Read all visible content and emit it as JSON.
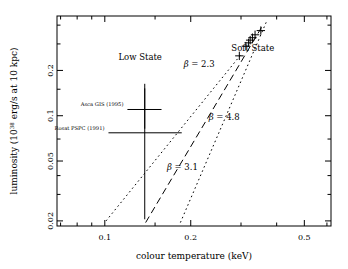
{
  "figure": {
    "kind": "scientific-scatter-plot",
    "background": "#ffffff",
    "ink": "#000000"
  },
  "axes": {
    "x": {
      "label_parts": {
        "text": "colour temperature (keV)"
      },
      "scale": "log",
      "range": [
        0.068,
        0.62
      ],
      "ticks": [
        {
          "value": 0.1,
          "label": "0.1"
        },
        {
          "value": 0.2,
          "label": "0.2"
        },
        {
          "value": 0.5,
          "label": "0.5"
        }
      ],
      "minor_ticks": [
        0.07,
        0.08,
        0.09,
        0.15,
        0.3,
        0.4,
        0.6
      ]
    },
    "y": {
      "label_parts": {
        "prefix": "luminosity (10",
        "exponent": "38",
        "suffix": " erg/s at 10 kpc)"
      },
      "scale": "log",
      "range": [
        0.0185,
        0.46
      ],
      "ticks": [
        {
          "value": 0.02,
          "label": "0.02"
        },
        {
          "value": 0.05,
          "label": "0.05"
        },
        {
          "value": 0.1,
          "label": "0.1"
        },
        {
          "value": 0.2,
          "label": "0.2"
        }
      ],
      "minor_ticks": [
        0.03,
        0.04,
        0.07,
        0.15,
        0.3,
        0.4
      ]
    }
  },
  "annotations": {
    "low_state": "Low State",
    "soft_state": "Soft State",
    "asca": "Asca GIS (1995)",
    "rosat": "Rosat PSPC (1991)"
  },
  "chart_data": {
    "type": "scatter",
    "title": "",
    "xlabel": "colour temperature (keV)",
    "ylabel": "luminosity (10^38 erg/s at 10 kpc)",
    "xscale": "log",
    "yscale": "log",
    "xlim": [
      0.068,
      0.62
    ],
    "ylim": [
      0.0185,
      0.46
    ],
    "grid": false,
    "legend": "none",
    "series": [
      {
        "name": "Soft State",
        "marker": "plus",
        "x": [
          0.296,
          0.312,
          0.319,
          0.323,
          0.329,
          0.336,
          0.352
        ],
        "y": [
          0.25,
          0.29,
          0.305,
          0.318,
          0.33,
          0.345,
          0.368
        ]
      },
      {
        "name": "Low State",
        "marker": "plus-with-errorbars",
        "points": [
          {
            "label": "Asca GIS (1995)",
            "x": 0.138,
            "y": 0.11,
            "xerr_lo": 0.12,
            "xerr_hi": 0.158,
            "yerr_lo": 0.082,
            "yerr_hi": 0.152
          },
          {
            "label": "Rosat PSPC (1991)",
            "x": 0.138,
            "y": 0.077,
            "xerr_lo": 0.103,
            "xerr_hi": 0.186,
            "yerr_lo": 0.0205,
            "yerr_hi": 0.163
          }
        ]
      }
    ],
    "lines": [
      {
        "name": "beta = 2.3",
        "label": "2.3",
        "style": "dotted",
        "slope_beta": 2.3,
        "x": [
          0.101,
          0.3
        ],
        "y": [
          0.02,
          0.255
        ]
      },
      {
        "name": "beta = 3.1",
        "label": "3.1",
        "style": "dashed",
        "slope_beta": 3.1,
        "x": [
          0.139,
          0.355
        ],
        "y": [
          0.0195,
          0.39
        ]
      },
      {
        "name": "beta = 4.8",
        "label": "4.8",
        "style": "dotted",
        "slope_beta": 4.8,
        "x": [
          0.184,
          0.368
        ],
        "y": [
          0.0195,
          0.42
        ]
      }
    ],
    "annotations": [
      {
        "text": "Low State",
        "x": 0.133,
        "y": 0.235
      },
      {
        "text": "Soft State",
        "x": 0.33,
        "y": 0.268
      },
      {
        "text": "β = 2.3",
        "x": 0.214,
        "y": 0.212
      },
      {
        "text": "β = 4.8",
        "x": 0.262,
        "y": 0.094
      },
      {
        "text": "β = 3.1",
        "x": 0.187,
        "y": 0.0435
      }
    ]
  }
}
